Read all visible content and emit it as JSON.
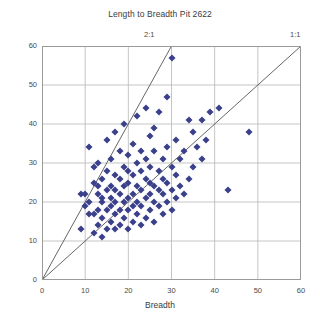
{
  "chart_data": {
    "type": "scatter",
    "title": "Length to Breadth Pit 2622",
    "xlabel": "Breadth",
    "ylabel": "Length",
    "xlim": [
      0,
      60
    ],
    "ylim": [
      0,
      60
    ],
    "xticks": [
      0,
      10,
      20,
      30,
      40,
      50,
      60
    ],
    "yticks": [
      0,
      10,
      20,
      30,
      40,
      50,
      60
    ],
    "grid": true,
    "legend": "none",
    "marker": {
      "shape": "diamond",
      "color": "#3a4089",
      "size": 5
    },
    "reference_lines": [
      {
        "label": "2:1",
        "slope": 2,
        "intercept": 0,
        "color": "#555555"
      },
      {
        "label": "1:1",
        "slope": 1,
        "intercept": 0,
        "color": "#555555"
      }
    ],
    "points": [
      [
        9,
        22
      ],
      [
        9,
        13
      ],
      [
        10,
        19
      ],
      [
        10,
        22
      ],
      [
        11,
        17
      ],
      [
        11,
        20
      ],
      [
        11,
        34
      ],
      [
        12,
        12
      ],
      [
        12,
        17
      ],
      [
        12,
        25
      ],
      [
        12,
        29
      ],
      [
        13,
        14
      ],
      [
        13,
        18
      ],
      [
        13,
        22
      ],
      [
        13,
        24
      ],
      [
        13,
        30
      ],
      [
        14,
        11
      ],
      [
        14,
        16
      ],
      [
        14,
        20
      ],
      [
        14,
        21
      ],
      [
        14,
        26
      ],
      [
        15,
        13
      ],
      [
        15,
        18
      ],
      [
        15,
        23
      ],
      [
        15,
        28
      ],
      [
        15,
        36
      ],
      [
        16,
        15
      ],
      [
        16,
        19
      ],
      [
        16,
        21
      ],
      [
        16,
        24
      ],
      [
        16,
        31
      ],
      [
        17,
        13
      ],
      [
        17,
        17
      ],
      [
        17,
        20
      ],
      [
        17,
        23
      ],
      [
        17,
        27
      ],
      [
        17,
        38
      ],
      [
        18,
        14
      ],
      [
        18,
        18
      ],
      [
        18,
        22
      ],
      [
        18,
        26
      ],
      [
        18,
        33
      ],
      [
        19,
        16
      ],
      [
        19,
        20
      ],
      [
        19,
        24
      ],
      [
        19,
        29
      ],
      [
        19,
        40
      ],
      [
        20,
        13
      ],
      [
        20,
        18
      ],
      [
        20,
        21
      ],
      [
        20,
        25
      ],
      [
        20,
        28
      ],
      [
        20,
        32
      ],
      [
        21,
        15
      ],
      [
        21,
        19
      ],
      [
        21,
        22
      ],
      [
        21,
        27
      ],
      [
        21,
        35
      ],
      [
        22,
        17
      ],
      [
        22,
        20
      ],
      [
        22,
        24
      ],
      [
        22,
        30
      ],
      [
        22,
        42
      ],
      [
        23,
        14
      ],
      [
        23,
        19
      ],
      [
        23,
        23
      ],
      [
        23,
        28
      ],
      [
        23,
        33
      ],
      [
        24,
        16
      ],
      [
        24,
        21
      ],
      [
        24,
        26
      ],
      [
        24,
        31
      ],
      [
        24,
        44
      ],
      [
        25,
        18
      ],
      [
        25,
        22
      ],
      [
        25,
        25
      ],
      [
        25,
        29
      ],
      [
        25,
        37
      ],
      [
        26,
        15
      ],
      [
        26,
        20
      ],
      [
        26,
        24
      ],
      [
        26,
        33
      ],
      [
        26,
        39
      ],
      [
        27,
        19
      ],
      [
        27,
        23
      ],
      [
        27,
        28
      ],
      [
        27,
        43
      ],
      [
        28,
        17
      ],
      [
        28,
        22
      ],
      [
        28,
        26
      ],
      [
        28,
        31
      ],
      [
        29,
        20
      ],
      [
        29,
        25
      ],
      [
        29,
        34
      ],
      [
        29,
        47
      ],
      [
        30,
        18
      ],
      [
        30,
        23
      ],
      [
        30,
        29
      ],
      [
        30,
        57
      ],
      [
        31,
        21
      ],
      [
        31,
        27
      ],
      [
        31,
        36
      ],
      [
        32,
        24
      ],
      [
        32,
        31
      ],
      [
        33,
        22
      ],
      [
        33,
        33
      ],
      [
        34,
        26
      ],
      [
        34,
        41
      ],
      [
        35,
        29
      ],
      [
        35,
        38
      ],
      [
        36,
        34
      ],
      [
        37,
        31
      ],
      [
        37,
        41
      ],
      [
        38,
        36
      ],
      [
        39,
        43
      ],
      [
        41,
        44
      ],
      [
        43,
        23
      ],
      [
        48,
        38
      ]
    ]
  }
}
